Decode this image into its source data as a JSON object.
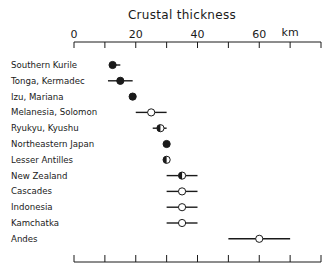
{
  "chart_data": {
    "type": "scatter",
    "title": "Crustal thickness",
    "xlabel": "km",
    "ylabel": "",
    "xlim": [
      0,
      80
    ],
    "x_ticks": [
      0,
      10,
      20,
      30,
      40,
      50,
      60,
      70,
      80
    ],
    "x_tick_labels": [
      "0",
      "20",
      "40",
      "60"
    ],
    "x_tick_label_values": [
      0,
      20,
      40,
      60
    ],
    "grid": false,
    "legend": null,
    "marker_fill_note": "filled = solid black, open = white, half = left half black",
    "categories": [
      "Southern Kurile",
      "Tonga, Kermadec",
      "Izu, Mariana",
      "Melanesia, Solomon",
      "Ryukyu, Kyushu",
      "Northeastern Japan",
      "Lesser Antilles",
      "New Zealand",
      "Cascades",
      "Indonesia",
      "Kamchatka",
      "Andes"
    ],
    "points": [
      {
        "name": "Southern Kurile",
        "value": 12.5,
        "min": 11.5,
        "max": 15,
        "marker": "filled"
      },
      {
        "name": "Tonga, Kermadec",
        "value": 15,
        "min": 11,
        "max": 19,
        "marker": "filled"
      },
      {
        "name": "Izu, Mariana",
        "value": 19,
        "min": null,
        "max": null,
        "marker": "filled"
      },
      {
        "name": "Melanesia, Solomon",
        "value": 25,
        "min": 20,
        "max": 30,
        "marker": "open"
      },
      {
        "name": "Ryukyu, Kyushu",
        "value": 28,
        "min": 25.5,
        "max": 30,
        "marker": "half"
      },
      {
        "name": "Northeastern Japan",
        "value": 30,
        "min": null,
        "max": null,
        "marker": "filled"
      },
      {
        "name": "Lesser Antilles",
        "value": 30,
        "min": null,
        "max": null,
        "marker": "half"
      },
      {
        "name": "New Zealand",
        "value": 35,
        "min": 30,
        "max": 40,
        "marker": "half"
      },
      {
        "name": "Cascades",
        "value": 35,
        "min": 30,
        "max": 40,
        "marker": "open"
      },
      {
        "name": "Indonesia",
        "value": 35,
        "min": 30,
        "max": 40,
        "marker": "open"
      },
      {
        "name": "Kamchatka",
        "value": 35,
        "min": 30,
        "max": 40,
        "marker": "open"
      },
      {
        "name": "Andes",
        "value": 60,
        "min": 50,
        "max": 70,
        "marker": "open"
      }
    ]
  },
  "colors": {
    "ink": "#1a1a1a",
    "background": "#ffffff"
  }
}
